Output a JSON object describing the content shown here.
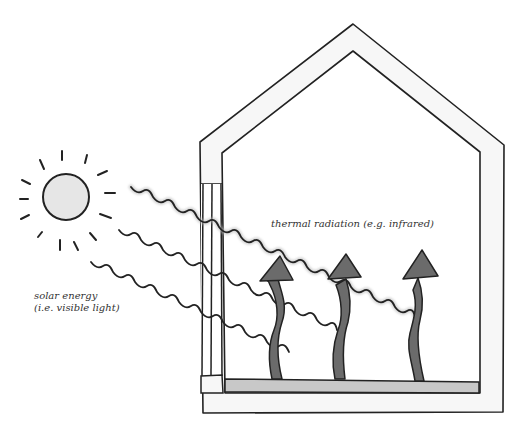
{
  "diagram": {
    "type": "greenhouse-effect-illustration",
    "labels": {
      "solar_energy_line1": "solar energy",
      "solar_energy_line2": "(i.e. visible light)",
      "thermal_radiation": "thermal radiation (e.g. infrared)"
    },
    "elements": {
      "sun": "sun with rays",
      "house": "greenhouse cross-section with pitched roof",
      "window": "glass window on left wall",
      "floor": "heat-absorbing floor",
      "incoming_rays": 3,
      "outgoing_arrows": 3
    },
    "colors": {
      "outline": "#222222",
      "sun_fill": "#e6e6e6",
      "arrow_fill": "#6b6b6b",
      "floor_fill": "#c8c8c8",
      "wall_fill": "#f7f7f7"
    }
  }
}
